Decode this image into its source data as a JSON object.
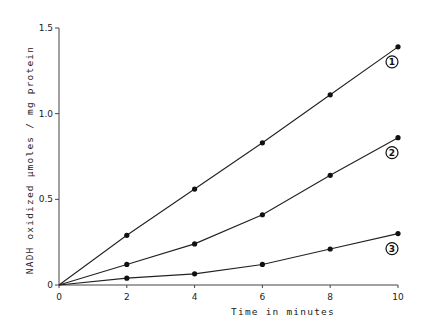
{
  "chart_data": {
    "type": "line",
    "title": "",
    "xlabel": "Time in minutes",
    "ylabel": "NADH oxidized μmoles / mg protein",
    "xlim": [
      0,
      10
    ],
    "ylim": [
      0,
      1.5
    ],
    "x_ticks": [
      0,
      2,
      4,
      6,
      8,
      10
    ],
    "x_tick_labels": [
      "0",
      "2",
      "4",
      "6",
      "8",
      "10"
    ],
    "y_ticks": [
      0,
      0.5,
      1.0,
      1.5
    ],
    "y_tick_labels": [
      "0",
      "0.5",
      "1.0",
      "1.5"
    ],
    "grid": false,
    "legend": "inline circled numbers at line ends",
    "x": [
      0,
      2,
      4,
      6,
      8,
      10
    ],
    "series": [
      {
        "name": "1",
        "label": "①",
        "values": [
          0,
          0.29,
          0.56,
          0.83,
          1.11,
          1.39
        ]
      },
      {
        "name": "2",
        "label": "②",
        "values": [
          0,
          0.12,
          0.24,
          0.41,
          0.64,
          0.86
        ]
      },
      {
        "name": "3",
        "label": "③",
        "values": [
          0,
          0.04,
          0.065,
          0.12,
          0.21,
          0.3
        ]
      }
    ]
  },
  "colors": {
    "line": "#222222",
    "marker": "#111111",
    "axis": "#444444"
  }
}
